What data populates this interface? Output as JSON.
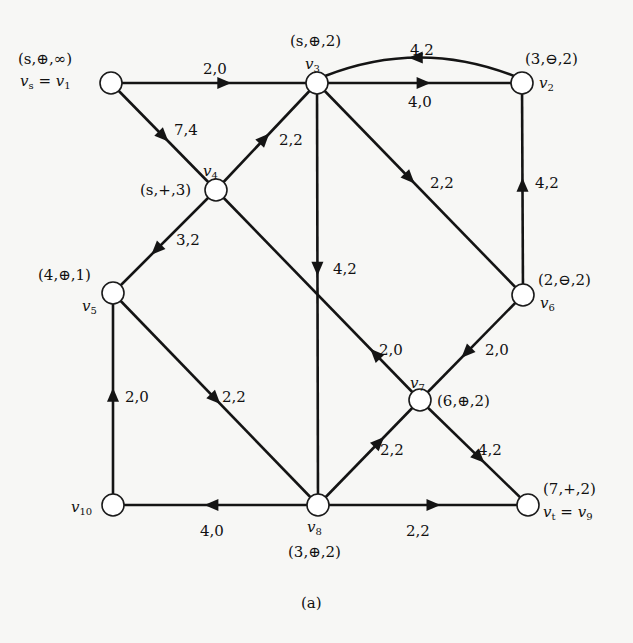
{
  "diagram": {
    "type": "flow-network",
    "caption": "(a)",
    "nodes": [
      {
        "id": "v1",
        "x": 111,
        "y": 83,
        "name": "v",
        "sub": "1",
        "prefix": "v",
        "prefix_sub": "s",
        "display": "v_s = v_1",
        "tag": "(s,⊕,∞)",
        "name_pos": {
          "x": 20,
          "y": 74,
          "anchor": "left"
        },
        "tag_pos": {
          "x": 18,
          "y": 52
        }
      },
      {
        "id": "v3",
        "x": 317,
        "y": 83,
        "name": "v",
        "sub": "3",
        "display": "v_3",
        "tag": "(s,⊕,2)",
        "name_pos": {
          "x": 305,
          "y": 57
        },
        "tag_pos": {
          "x": 290,
          "y": 34
        }
      },
      {
        "id": "v2",
        "x": 522,
        "y": 83,
        "name": "v",
        "sub": "2",
        "display": "v_2",
        "tag": "(3,⊖,2)",
        "name_pos": {
          "x": 539,
          "y": 76
        },
        "tag_pos": {
          "x": 525,
          "y": 52
        }
      },
      {
        "id": "v4",
        "x": 216,
        "y": 190,
        "name": "v",
        "sub": "4",
        "display": "v_4",
        "tag": "(s,+,3)",
        "name_pos": {
          "x": 203,
          "y": 164
        },
        "tag_pos": {
          "x": 140,
          "y": 183
        }
      },
      {
        "id": "v5",
        "x": 113,
        "y": 293,
        "name": "v",
        "sub": "5",
        "display": "v_5",
        "tag": "(4,⊕,1)",
        "name_pos": {
          "x": 82,
          "y": 299
        },
        "tag_pos": {
          "x": 38,
          "y": 268
        }
      },
      {
        "id": "v6",
        "x": 523,
        "y": 295,
        "name": "v",
        "sub": "6",
        "display": "v_6",
        "tag": "(2,⊖,2)",
        "name_pos": {
          "x": 540,
          "y": 296
        },
        "tag_pos": {
          "x": 538,
          "y": 273
        }
      },
      {
        "id": "v7",
        "x": 420,
        "y": 400,
        "name": "v",
        "sub": "7",
        "display": "v_7",
        "tag": "(6,⊕,2)",
        "name_pos": {
          "x": 410,
          "y": 376
        },
        "tag_pos": {
          "x": 437,
          "y": 394
        }
      },
      {
        "id": "v10",
        "x": 113,
        "y": 505,
        "name": "v",
        "sub": "10",
        "display": "v_10",
        "tag": "",
        "name_pos": {
          "x": 71,
          "y": 500
        },
        "tag_pos": null
      },
      {
        "id": "v8",
        "x": 318,
        "y": 505,
        "name": "v",
        "sub": "8",
        "display": "v_8",
        "tag": "(3,⊕,2)",
        "name_pos": {
          "x": 307,
          "y": 520
        },
        "tag_pos": {
          "x": 288,
          "y": 545
        }
      },
      {
        "id": "v9",
        "x": 528,
        "y": 505,
        "name": "v",
        "sub": "9",
        "prefix": "v",
        "prefix_sub": "t",
        "display": "v_t = v_9",
        "tag": "(7,+,2)",
        "name_pos": {
          "x": 543,
          "y": 505
        },
        "tag_pos": {
          "x": 543,
          "y": 482
        }
      }
    ],
    "edges": [
      {
        "from": "v1",
        "to": "v3",
        "capacity": 2,
        "flow": 0,
        "label": "2,0",
        "arrow_t": 0.55,
        "label_pos": {
          "x": 203,
          "y": 62
        }
      },
      {
        "from": "v1",
        "to": "v4",
        "capacity": 7,
        "flow": 4,
        "label": "7,4",
        "arrow_t": 0.5,
        "label_pos": {
          "x": 174,
          "y": 123
        }
      },
      {
        "from": "v4",
        "to": "v3",
        "capacity": 2,
        "flow": 2,
        "label": "2,2",
        "arrow_t": 0.48,
        "label_pos": {
          "x": 279,
          "y": 133
        }
      },
      {
        "from": "v2",
        "to": "v3",
        "capacity": 4,
        "flow": 2,
        "label": "4,2",
        "curved": true,
        "arrow_t": 0.52,
        "label_pos": {
          "x": 410,
          "y": 43
        }
      },
      {
        "from": "v3",
        "to": "v2",
        "capacity": 4,
        "flow": 0,
        "label": "4,0",
        "arrow_t": 0.52,
        "label_pos": {
          "x": 408,
          "y": 95
        }
      },
      {
        "from": "v3",
        "to": "v6",
        "capacity": 2,
        "flow": 2,
        "label": "2,2",
        "arrow_t": 0.45,
        "label_pos": {
          "x": 430,
          "y": 176
        }
      },
      {
        "from": "v6",
        "to": "v2",
        "capacity": 4,
        "flow": 2,
        "label": "4,2",
        "arrow_t": 0.52,
        "label_pos": {
          "x": 535,
          "y": 176
        }
      },
      {
        "from": "v3",
        "to": "v8",
        "capacity": 4,
        "flow": 2,
        "label": "4,2",
        "arrow_t": 0.44,
        "label_pos": {
          "x": 333,
          "y": 262
        }
      },
      {
        "from": "v4",
        "to": "v5",
        "capacity": 3,
        "flow": 2,
        "label": "3,2",
        "arrow_t": 0.58,
        "label_pos": {
          "x": 176,
          "y": 233
        }
      },
      {
        "from": "v7",
        "to": "v4",
        "capacity": 2,
        "flow": 0,
        "label": "2,0",
        "arrow_t": 0.22,
        "label_pos": {
          "x": 379,
          "y": 343
        }
      },
      {
        "from": "v6",
        "to": "v7",
        "capacity": 2,
        "flow": 0,
        "label": "2,0",
        "arrow_t": 0.55,
        "label_pos": {
          "x": 485,
          "y": 343
        }
      },
      {
        "from": "v5",
        "to": "v8",
        "capacity": 2,
        "flow": 2,
        "label": "2,2",
        "arrow_t": 0.5,
        "label_pos": {
          "x": 222,
          "y": 390
        }
      },
      {
        "from": "v10",
        "to": "v5",
        "capacity": 2,
        "flow": 0,
        "label": "2,0",
        "arrow_t": 0.52,
        "label_pos": {
          "x": 125,
          "y": 390
        }
      },
      {
        "from": "v8",
        "to": "v7",
        "capacity": 2,
        "flow": 2,
        "label": "2,2",
        "arrow_t": 0.6,
        "label_pos": {
          "x": 380,
          "y": 443
        }
      },
      {
        "from": "v7",
        "to": "v9",
        "capacity": 4,
        "flow": 2,
        "label": "4,2",
        "arrow_t": 0.55,
        "label_pos": {
          "x": 478,
          "y": 443
        }
      },
      {
        "from": "v8",
        "to": "v10",
        "capacity": 4,
        "flow": 0,
        "label": "4,0",
        "arrow_t": 0.52,
        "label_pos": {
          "x": 200,
          "y": 524
        }
      },
      {
        "from": "v8",
        "to": "v9",
        "capacity": 2,
        "flow": 2,
        "label": "2,2",
        "arrow_t": 0.55,
        "label_pos": {
          "x": 406,
          "y": 524
        }
      }
    ],
    "caption_pos": {
      "x": 309,
      "y": 602
    },
    "colors": {
      "stroke": "#141414",
      "node_fill": "#ffffff",
      "background": "#f7f7f5"
    }
  }
}
